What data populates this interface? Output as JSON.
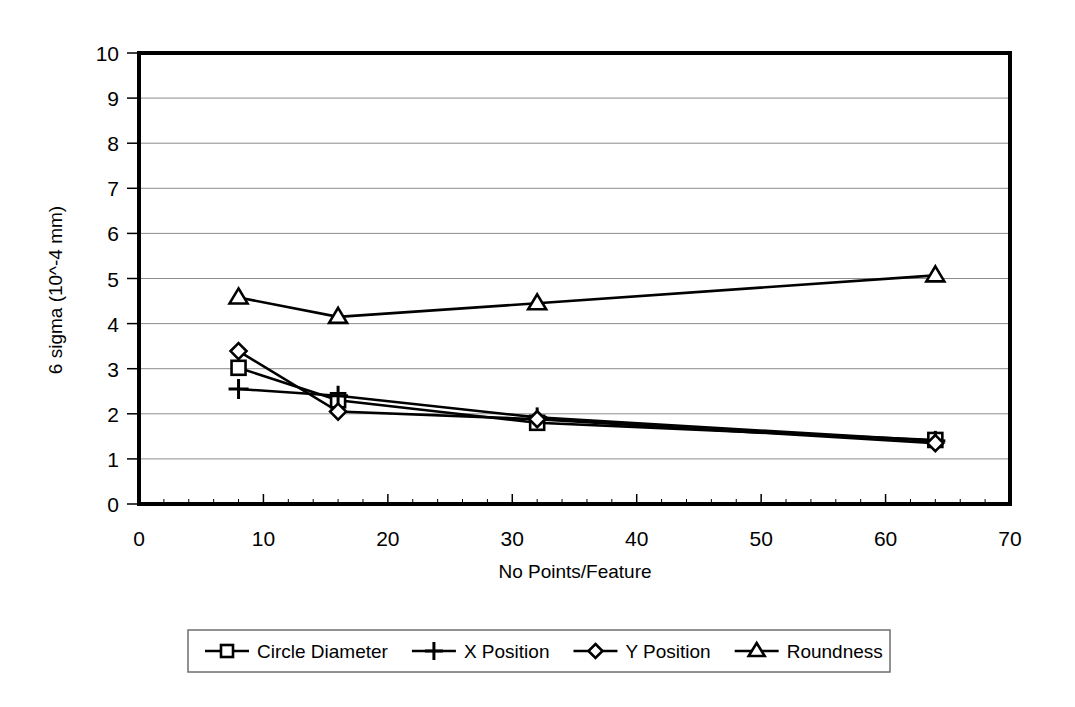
{
  "chart_data": {
    "type": "line",
    "title": "",
    "xlabel": "No Points/Feature",
    "ylabel": "6 sigma (10^-4 mm)",
    "x": [
      8,
      16,
      32,
      64
    ],
    "xlim": [
      0,
      70
    ],
    "ylim": [
      0,
      10
    ],
    "xticks": [
      "0",
      "10",
      "20",
      "30",
      "40",
      "50",
      "60",
      "70"
    ],
    "xtick_values": [
      0,
      10,
      20,
      30,
      40,
      50,
      60,
      70
    ],
    "yticks": [
      "0",
      "1",
      "2",
      "3",
      "4",
      "5",
      "6",
      "7",
      "8",
      "9",
      "10"
    ],
    "ytick_values": [
      0,
      1,
      2,
      3,
      4,
      5,
      6,
      7,
      8,
      9,
      10
    ],
    "grid": "horizontal",
    "legend_position": "bottom",
    "series": [
      {
        "name": "Circle Diameter",
        "marker": "square",
        "values": [
          3.02,
          2.3,
          1.8,
          1.42
        ]
      },
      {
        "name": "X Position",
        "marker": "plus",
        "values": [
          2.55,
          2.4,
          1.92,
          1.4
        ]
      },
      {
        "name": "Y Position",
        "marker": "diamond",
        "values": [
          3.39,
          2.05,
          1.88,
          1.35
        ]
      },
      {
        "name": "Roundness",
        "marker": "triangle",
        "values": [
          4.58,
          4.15,
          4.45,
          5.07
        ]
      }
    ],
    "colors": {
      "line": "#000000",
      "marker_fill": "#ffffff",
      "grid": "#8c8c8c",
      "frame": "#000000",
      "background": "#ffffff"
    }
  },
  "axis": {
    "y_title": "6 sigma (10^-4 mm)",
    "x_title": "No Points/Feature"
  },
  "legend": {
    "items": [
      {
        "label": "Circle Diameter",
        "marker": "square-marker"
      },
      {
        "label": "X Position",
        "marker": "plus-marker"
      },
      {
        "label": "Y Position",
        "marker": "diamond-marker"
      },
      {
        "label": "Roundness",
        "marker": "triangle-marker"
      }
    ]
  }
}
